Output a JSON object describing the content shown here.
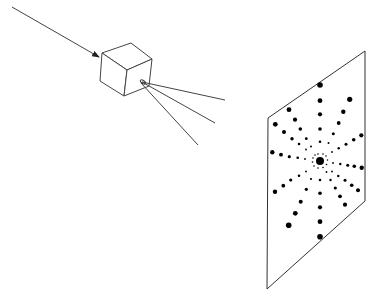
{
  "diagram": {
    "colors": {
      "line": "#444444",
      "dot": "#000000",
      "background": "#ffffff"
    },
    "incident_beam": {
      "from": [
        12,
        7
      ],
      "to": [
        99,
        57
      ]
    },
    "crystal": {
      "faces": {
        "top": "102,53 131,43 152,59 127,70",
        "front": "102,53 127,70 124,96 100,81",
        "side": "127,70 152,59 149,86 124,96"
      }
    },
    "diffracted_rays": [
      {
        "from": [
          142,
          82
        ],
        "to": [
          225,
          100
        ]
      },
      {
        "from": [
          142,
          82
        ],
        "to": [
          215,
          123
        ]
      },
      {
        "from": [
          141,
          83
        ],
        "to": [
          198,
          145
        ]
      }
    ],
    "ray_origin_marker": {
      "cx": 143,
      "cy": 82,
      "rx": 3,
      "ry": 1.5
    },
    "screen": {
      "points": "268,118 365,51 365,201 267,289"
    },
    "center_spot": {
      "x": 320,
      "y": 161,
      "r": 4
    },
    "spokes": [
      {
        "name": "up",
        "dots": [
          [
            320,
            85,
            2.8
          ],
          [
            320,
            100.7,
            2.4
          ],
          [
            320,
            114.3,
            2.1
          ],
          [
            320,
            129,
            1.8
          ],
          [
            320,
            141.7,
            1.3
          ]
        ]
      },
      {
        "name": "down",
        "dots": [
          [
            320,
            180,
            1.3
          ],
          [
            320,
            193.3,
            1.8
          ],
          [
            320,
            207.3,
            2.1
          ],
          [
            320,
            221.7,
            2.4
          ],
          [
            320,
            236.7,
            2.8
          ]
        ]
      },
      {
        "name": "upper-right",
        "dots": [
          [
            349.7,
            99.3,
            2.6
          ],
          [
            343.3,
            111.7,
            2.2
          ],
          [
            338.7,
            123,
            1.9
          ],
          [
            333.3,
            133.7,
            1.5
          ],
          [
            328.5,
            143,
            1.0
          ]
        ]
      },
      {
        "name": "upper-right-low",
        "dots": [
          [
            361.3,
            135.3,
            2.1
          ],
          [
            353.7,
            139.7,
            1.8
          ],
          [
            346,
            144.3,
            1.5
          ],
          [
            338.7,
            148.3,
            1.2
          ],
          [
            332,
            152,
            0.9
          ]
        ]
      },
      {
        "name": "right",
        "dots": [
          [
            361.7,
            167.7,
            2.2
          ],
          [
            354.3,
            166.3,
            1.8
          ],
          [
            347.7,
            165.3,
            1.5
          ],
          [
            340.3,
            164,
            1.2
          ],
          [
            333,
            163,
            0.9
          ]
        ]
      },
      {
        "name": "lower-right-high",
        "dots": [
          [
            358,
            190.3,
            2.0
          ],
          [
            351.7,
            185.3,
            1.8
          ],
          [
            345,
            180.3,
            1.5
          ],
          [
            338.3,
            176,
            1.2
          ],
          [
            332,
            171.5,
            0.9
          ]
        ]
      },
      {
        "name": "lower-right",
        "dots": [
          [
            345,
            204.7,
            2.1
          ],
          [
            340,
            196.3,
            1.9
          ],
          [
            335.3,
            188,
            1.6
          ],
          [
            330.5,
            180,
            1.2
          ],
          [
            326.5,
            172,
            0.9
          ]
        ]
      },
      {
        "name": "lower-left",
        "dots": [
          [
            288.7,
            225.3,
            2.8
          ],
          [
            295.3,
            213.3,
            2.4
          ],
          [
            300.7,
            201.7,
            2.0
          ],
          [
            306.3,
            189.3,
            1.6
          ],
          [
            311,
            179,
            1.1
          ]
        ]
      },
      {
        "name": "lower-left-high",
        "dots": [
          [
            275,
            191.7,
            2.2
          ],
          [
            283.3,
            185.7,
            1.9
          ],
          [
            290.7,
            180,
            1.6
          ],
          [
            299,
            175.7,
            1.3
          ],
          [
            306,
            171.5,
            0.9
          ]
        ]
      },
      {
        "name": "left",
        "dots": [
          [
            272.3,
            152.3,
            2.2
          ],
          [
            281,
            154.7,
            1.9
          ],
          [
            289.3,
            156.7,
            1.6
          ],
          [
            297.7,
            157.7,
            1.3
          ],
          [
            305,
            159,
            0.9
          ]
        ]
      },
      {
        "name": "upper-left-low",
        "dots": [
          [
            275.3,
            124.3,
            2.4
          ],
          [
            284,
            132,
            2.0
          ],
          [
            292,
            138.7,
            1.7
          ],
          [
            299,
            144,
            1.3
          ],
          [
            306,
            149.5,
            0.9
          ]
        ]
      },
      {
        "name": "upper-left",
        "dots": [
          [
            289,
            109.7,
            2.4
          ],
          [
            295,
            119.7,
            2.1
          ],
          [
            300.3,
            129,
            1.8
          ],
          [
            306.3,
            138.7,
            1.4
          ],
          [
            311,
            146.5,
            1.0
          ]
        ]
      }
    ],
    "inner_ring": [
      [
        315,
        155,
        0.8
      ],
      [
        318,
        154,
        0.8
      ],
      [
        323,
        154,
        0.8
      ],
      [
        326,
        156,
        0.8
      ],
      [
        327.5,
        160,
        0.8
      ],
      [
        326.5,
        164.5,
        0.8
      ],
      [
        323,
        167.5,
        0.8
      ],
      [
        318,
        168,
        0.8
      ],
      [
        314,
        166,
        0.8
      ],
      [
        312.5,
        162,
        0.8
      ],
      [
        313,
        158,
        0.8
      ]
    ]
  }
}
